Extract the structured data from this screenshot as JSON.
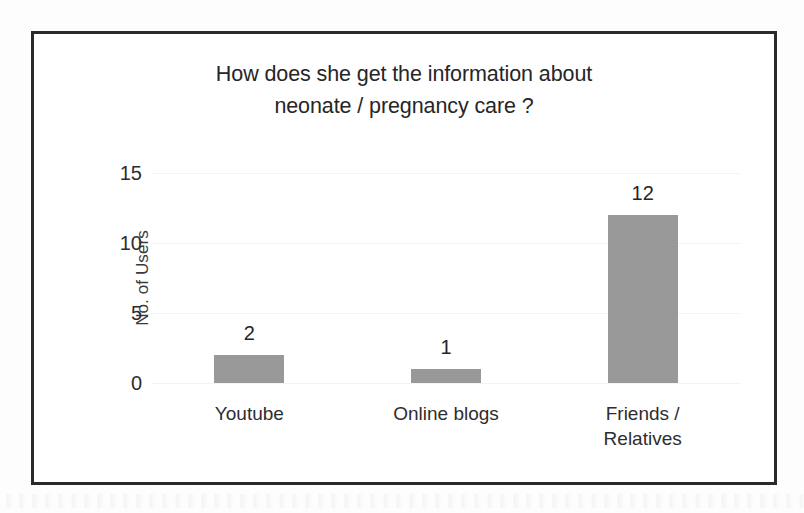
{
  "chart_data": {
    "type": "bar",
    "title": "How does she get the information about neonate / pregnancy care ?",
    "title_lines": [
      "How does she get the information about",
      "neonate / pregnancy care ?"
    ],
    "categories": [
      "Youtube",
      "Online blogs",
      "Friends / Relatives"
    ],
    "category_label_lines": [
      [
        "Youtube"
      ],
      [
        "Online blogs"
      ],
      [
        "Friends /",
        "Relatives"
      ]
    ],
    "values": [
      2,
      1,
      12
    ],
    "value_labels": [
      "2",
      "1",
      "12"
    ],
    "xlabel": "",
    "ylabel": "No. of Users",
    "ylim": [
      0,
      15
    ],
    "yticks": [
      0,
      5,
      10,
      15
    ],
    "ytick_labels": [
      "0",
      "5",
      "10",
      "15"
    ],
    "grid": true,
    "legend": false,
    "bar_color": "#989898",
    "text_color": "#262626",
    "frame_color": "#2a2a2a",
    "background": "#ffffff"
  }
}
